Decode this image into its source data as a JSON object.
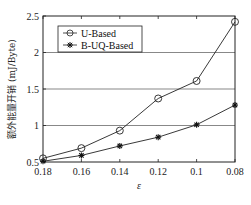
{
  "chart_data": {
    "type": "line",
    "title": "",
    "xlabel": "ε",
    "ylabel": "额外能量开销 (mJ/Byte)",
    "categories": [
      "0.18",
      "0.16",
      "0.14",
      "0.12",
      "0.1",
      "0.08"
    ],
    "x": [
      0.18,
      0.16,
      0.14,
      0.12,
      0.1,
      0.08
    ],
    "series": [
      {
        "name": "U-Based",
        "marker": "circle-open",
        "values": [
          0.55,
          0.69,
          0.93,
          1.37,
          1.61,
          2.42
        ]
      },
      {
        "name": "B-UQ-Based",
        "marker": "asterisk",
        "values": [
          0.51,
          0.59,
          0.72,
          0.84,
          1.01,
          1.28
        ]
      }
    ],
    "ylim": [
      0.5,
      2.5
    ],
    "yticks": [
      "0.5",
      "1",
      "1.5",
      "2",
      "2.5"
    ],
    "ytick_values": [
      0.5,
      1,
      1.5,
      2,
      2.5
    ],
    "grid": "horizontal",
    "legend_position": "upper left"
  }
}
